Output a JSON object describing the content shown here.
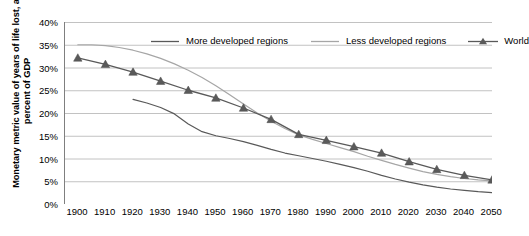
{
  "chart_data": {
    "type": "line",
    "title": "",
    "xlabel": "",
    "ylabel": "Monetary metric value of years of life lost, as percent of GDP",
    "xlim": [
      1900,
      2055
    ],
    "ylim": [
      0,
      0.4
    ],
    "ytick_labels": [
      "0%",
      "5%",
      "10%",
      "15%",
      "20%",
      "25%",
      "30%",
      "35%",
      "40%"
    ],
    "ytick_values": [
      0,
      5,
      10,
      15,
      20,
      25,
      30,
      35,
      40
    ],
    "xtick_labels": [
      "1900",
      "1910",
      "1920",
      "1930",
      "1940",
      "1950",
      "1960",
      "1970",
      "1980",
      "1990",
      "2000",
      "2010",
      "2020",
      "2030",
      "2040",
      "2050"
    ],
    "xtick_values": [
      1900,
      1910,
      1920,
      1930,
      1940,
      1950,
      1960,
      1970,
      1980,
      1990,
      2000,
      2010,
      2020,
      2030,
      2040,
      2050
    ],
    "grid": "horizontal",
    "legend_position": "top",
    "series": [
      {
        "name": "More developed regions",
        "color": "#595959",
        "marker": "none",
        "x": [
          1925,
          1930,
          1935,
          1940,
          1945,
          1950,
          1955,
          1960,
          1965,
          1970,
          1975,
          1980,
          1985,
          1990,
          1995,
          2000,
          2005,
          2010,
          2015,
          2020,
          2025,
          2030,
          2035,
          2040,
          2045,
          2050,
          2055
        ],
        "values": [
          23.0,
          22.2,
          21.2,
          19.8,
          17.6,
          15.9,
          15.0,
          14.4,
          13.7,
          12.9,
          12.0,
          11.2,
          10.6,
          10.0,
          9.4,
          8.7,
          8.0,
          7.2,
          6.3,
          5.5,
          4.8,
          4.2,
          3.7,
          3.3,
          3.0,
          2.7,
          2.5
        ]
      },
      {
        "name": "Less developed regions",
        "color": "#a6a6a6",
        "marker": "none",
        "x": [
          1905,
          1910,
          1915,
          1920,
          1925,
          1930,
          1935,
          1940,
          1945,
          1950,
          1955,
          1960,
          1965,
          1970,
          1975,
          1980,
          1985,
          1990,
          1995,
          2000,
          2005,
          2010,
          2015,
          2020,
          2025,
          2030,
          2035,
          2040,
          2045,
          2050,
          2055
        ],
        "values": [
          35.0,
          35.0,
          34.8,
          34.4,
          33.8,
          33.0,
          32.0,
          30.8,
          29.4,
          27.8,
          26.0,
          24.0,
          22.0,
          20.0,
          18.2,
          16.6,
          15.2,
          14.2,
          13.3,
          12.4,
          11.5,
          10.5,
          9.6,
          8.7,
          7.9,
          7.1,
          6.5,
          6.0,
          5.6,
          5.3,
          5.1
        ]
      },
      {
        "name": "World",
        "color": "#595959",
        "marker": "triangle",
        "x": [
          1905,
          1915,
          1925,
          1935,
          1945,
          1955,
          1965,
          1975,
          1985,
          1995,
          2005,
          2015,
          2025,
          2035,
          2045,
          2055
        ],
        "values": [
          32.1,
          30.7,
          29.0,
          27.0,
          25.0,
          23.3,
          21.1,
          18.6,
          15.3,
          14.0,
          12.6,
          11.2,
          9.3,
          7.6,
          6.3,
          5.3
        ]
      }
    ]
  },
  "legend": {
    "items": [
      {
        "label": "More developed regions",
        "color": "#595959",
        "marker": "none"
      },
      {
        "label": "Less developed regions",
        "color": "#a6a6a6",
        "marker": "none"
      },
      {
        "label": "World",
        "color": "#595959",
        "marker": "triangle"
      }
    ]
  },
  "axis_title": {
    "y": "Monetary metric value of years of life lost, as percent of GDP"
  }
}
